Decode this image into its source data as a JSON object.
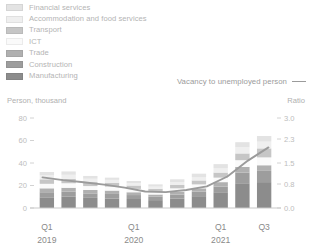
{
  "legend": {
    "items": [
      {
        "label": "Financial services",
        "color": "#e3e3e3"
      },
      {
        "label": "Accommodation and food services",
        "color": "#efefef"
      },
      {
        "label": "Transport",
        "color": "#c6c6c6"
      },
      {
        "label": "ICT",
        "color": "#fafafa"
      },
      {
        "label": "Trade",
        "color": "#b0b0b0"
      },
      {
        "label": "Construction",
        "color": "#9d9d9d"
      },
      {
        "label": "Manufacturing",
        "color": "#8c8c8c"
      }
    ]
  },
  "line_key": {
    "label": "Vacancy to unemployed person",
    "color": "#9b9b9b"
  },
  "axes": {
    "left_caption": "Person, thousand",
    "right_caption": "Ratio"
  },
  "chart_data": {
    "type": "bar",
    "title": "",
    "xlabel": "",
    "ylabel": "Person, thousand",
    "y2label": "Ratio",
    "grid": false,
    "legend_position": "top-left",
    "stacked": true,
    "categories": [
      "Q1 2019",
      "Q2 2019",
      "Q3 2019",
      "Q4 2019",
      "Q1 2020",
      "Q2 2020",
      "Q3 2020",
      "Q4 2020",
      "Q1 2021",
      "Q2 2021",
      "Q3 2021"
    ],
    "x_tick_labels": [
      {
        "index": 0,
        "quarter": "Q1",
        "year": "2019"
      },
      {
        "index": 4,
        "quarter": "Q1",
        "year": "2020"
      },
      {
        "index": 8,
        "quarter": "Q1",
        "year": "2021"
      },
      {
        "index": 10,
        "quarter": "Q3",
        "year": ""
      }
    ],
    "ylim": [
      0,
      80
    ],
    "yticks": [
      0,
      20,
      40,
      60,
      80
    ],
    "ytick_labels": [
      "0",
      "20",
      "40",
      "60",
      "80"
    ],
    "y2lim": [
      0,
      3.0
    ],
    "y2ticks": [
      0.0,
      0.8,
      1.5,
      2.3,
      3.0
    ],
    "y2tick_labels": [
      "0.0",
      "0.8",
      "1.5",
      "2.3",
      "3.0"
    ],
    "series": [
      {
        "name": "Manufacturing",
        "color": "#8c8c8c",
        "values": [
          9.5,
          10.0,
          9.0,
          8.5,
          8.0,
          7.0,
          8.5,
          10.5,
          14.0,
          22.0,
          23.0
        ]
      },
      {
        "name": "Construction",
        "color": "#9d9d9d",
        "values": [
          4.5,
          4.5,
          4.0,
          4.0,
          3.5,
          3.0,
          3.5,
          4.0,
          5.0,
          9.5,
          10.0
        ]
      },
      {
        "name": "Trade",
        "color": "#b0b0b0",
        "values": [
          3.5,
          3.5,
          3.0,
          3.0,
          2.5,
          2.0,
          2.5,
          3.0,
          4.0,
          5.0,
          5.0
        ]
      },
      {
        "name": "ICT",
        "color": "#fafafa",
        "values": [
          4.0,
          4.0,
          3.5,
          3.5,
          3.0,
          2.5,
          3.0,
          3.5,
          4.0,
          6.0,
          7.0
        ]
      },
      {
        "name": "Transport",
        "color": "#c6c6c6",
        "values": [
          4.0,
          4.0,
          3.5,
          3.5,
          3.0,
          2.5,
          3.0,
          3.5,
          4.5,
          6.0,
          8.0
        ]
      },
      {
        "name": "Accommodation and food services",
        "color": "#efefef",
        "values": [
          3.5,
          3.5,
          3.0,
          2.5,
          2.0,
          2.0,
          2.5,
          3.0,
          4.0,
          5.5,
          6.0
        ]
      },
      {
        "name": "Financial services",
        "color": "#e3e3e3",
        "values": [
          3.0,
          3.0,
          2.5,
          2.0,
          2.0,
          2.0,
          2.5,
          3.0,
          3.5,
          4.5,
          5.0
        ]
      }
    ],
    "line_series": {
      "name": "Vacancy to unemployed person",
      "color": "#9b9b9b",
      "axis": "right",
      "values": [
        1.02,
        0.93,
        0.86,
        0.78,
        0.68,
        0.55,
        0.53,
        0.6,
        0.72,
        1.05,
        1.58,
        2.02
      ]
    }
  }
}
